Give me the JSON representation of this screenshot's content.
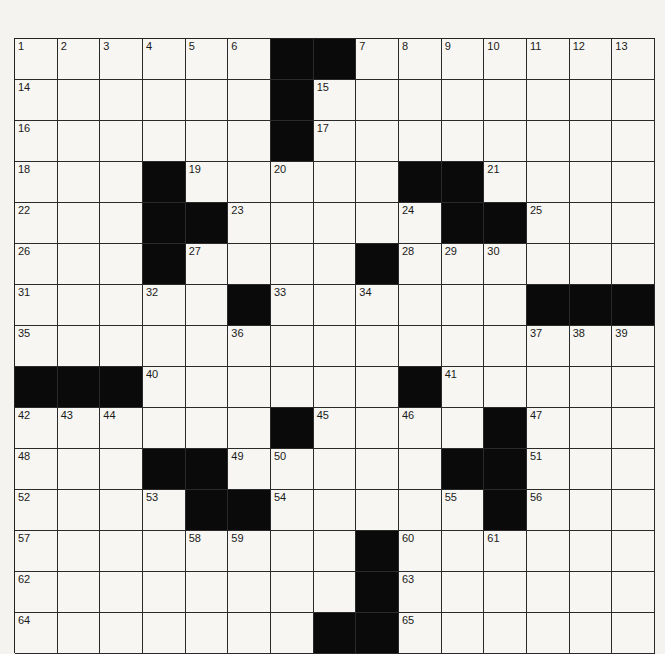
{
  "puzzle": {
    "rows": 15,
    "cols": 15,
    "grid": [
      [
        "1",
        "2",
        "3",
        "4",
        "5",
        "6",
        "#",
        "#",
        "7",
        "8",
        "9",
        "10",
        "11",
        "12",
        "13"
      ],
      [
        "14",
        "",
        "",
        "",
        "",
        "",
        "#",
        "15",
        "",
        "",
        "",
        "",
        "",
        "",
        ""
      ],
      [
        "16",
        "",
        "",
        "",
        "",
        "",
        "#",
        "17",
        "",
        "",
        "",
        "",
        "",
        "",
        ""
      ],
      [
        "18",
        "",
        "",
        "#",
        "19",
        "",
        "20",
        "",
        "",
        "#",
        "#",
        "21",
        "",
        "",
        ""
      ],
      [
        "22",
        "",
        "",
        "#",
        "#",
        "23",
        "",
        "",
        "",
        "24",
        "#",
        "#",
        "25",
        "",
        ""
      ],
      [
        "26",
        "",
        "",
        "#",
        "27",
        "",
        "",
        "",
        "#",
        "28",
        "29",
        "30",
        "",
        "",
        ""
      ],
      [
        "31",
        "",
        "",
        "32",
        "",
        "#",
        "33",
        "",
        "34",
        "",
        "",
        "",
        "#",
        "#",
        "#"
      ],
      [
        "35",
        "",
        "",
        "",
        "",
        "36",
        "",
        "",
        "",
        "",
        "",
        "",
        "37",
        "38",
        "39"
      ],
      [
        "#",
        "#",
        "#",
        "40",
        "",
        "",
        "",
        "",
        "",
        "#",
        "41",
        "",
        "",
        "",
        ""
      ],
      [
        "42",
        "43",
        "44",
        "",
        "",
        "",
        "#",
        "45",
        "",
        "46",
        "",
        "#",
        "47",
        "",
        ""
      ],
      [
        "48",
        "",
        "",
        "#",
        "#",
        "49",
        "50",
        "",
        "",
        "",
        "#",
        "#",
        "51",
        "",
        ""
      ],
      [
        "52",
        "",
        "",
        "53",
        "#",
        "#",
        "54",
        "",
        "",
        "",
        "55",
        "#",
        "56",
        "",
        ""
      ],
      [
        "57",
        "",
        "",
        "",
        "58",
        "59",
        "",
        "",
        "#",
        "60",
        "",
        "61",
        "",
        "",
        ""
      ],
      [
        "62",
        "",
        "",
        "",
        "",
        "",
        "",
        "",
        "#",
        "63",
        "",
        "",
        "",
        "",
        ""
      ],
      [
        "64",
        "",
        "",
        "",
        "",
        "",
        "",
        "#",
        "#",
        "65",
        "",
        "",
        "",
        "",
        ""
      ]
    ]
  }
}
